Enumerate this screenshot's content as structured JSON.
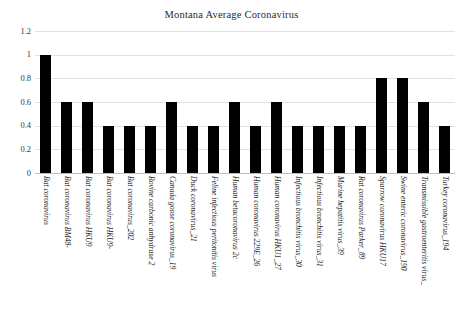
{
  "chart_data": {
    "type": "bar",
    "title": "Montana Average Coronavirus",
    "xlabel": "",
    "ylabel": "",
    "ylim": [
      0,
      1.2
    ],
    "yticks": [
      "0",
      "0.2",
      "0.4",
      "0.6",
      "0.8",
      "1",
      "1.2"
    ],
    "grid": true,
    "legend": null,
    "bar_color": "#000000",
    "categories": [
      "Bat coronavirus",
      "Bat coronavirus BM48-",
      "Bat coronavirus HKU9",
      "Bat coronavirus HKU9-",
      "Bat coronavirus_202",
      "Bovine carbonic anhydrase 2",
      "Canada goose coronavirus_19",
      "Duck coronavirus_21",
      "Feline infectious peritonitis virus",
      "Human betacoronavirus 2c",
      "Human coronavirus 229E_26",
      "Human coronavirus HKU1_27",
      "Infectious bronchitis virus_30",
      "Infectious bronchitis virus_31",
      "Murine hepatitis virus_39",
      "Rat coronavirus Parker_89",
      "Sparrow coronavirus HKU17",
      "Swine enteric coronavirus_190",
      "Transmissible gastroenteritis virus_",
      "Turkey coronavirus_194"
    ],
    "values": [
      1,
      0.6,
      0.6,
      0.4,
      0.4,
      0.4,
      0.6,
      0.4,
      0.4,
      0.6,
      0.4,
      0.6,
      0.4,
      0.4,
      0.4,
      0.4,
      0.8,
      0.8,
      0.6,
      0.4
    ]
  }
}
